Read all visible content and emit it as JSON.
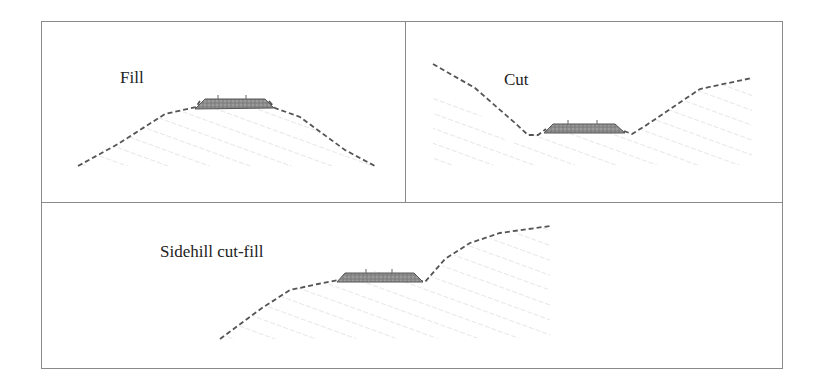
{
  "panels": [
    {
      "id": "fill",
      "label": "Fill"
    },
    {
      "id": "cut",
      "label": "Cut"
    },
    {
      "id": "sidehill",
      "label": "Sidehill cut-fill"
    }
  ],
  "colors": {
    "frame": "#8a8a8a",
    "ground_line": "#555555",
    "hatch": "#c8c8c8",
    "road": "#7a7a7a"
  }
}
